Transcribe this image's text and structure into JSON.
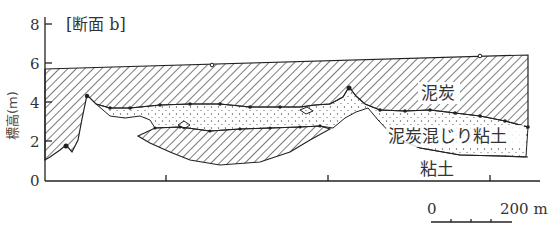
{
  "title": "[断面 b]",
  "y_axis": {
    "label": "標高(m)",
    "ticks": [
      "0",
      "2",
      "4",
      "6",
      "8"
    ]
  },
  "layers": {
    "peat": "泥炭",
    "peaty_clay": "泥炭混じり粘土",
    "clay": "粘土"
  },
  "scale_bar": {
    "start": "0",
    "end": "200 m"
  },
  "colors": {
    "line": "#222222",
    "hatch": "#333333",
    "dots": "#555555",
    "background": "#ffffff"
  }
}
